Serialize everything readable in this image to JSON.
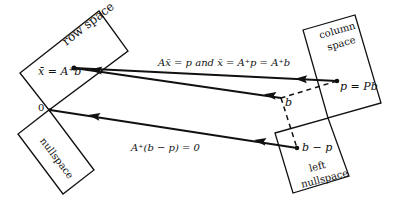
{
  "diagram": {
    "regions": {
      "row_space": "row space",
      "column_space_line1": "column",
      "column_space_line2": "space",
      "nullspace": "nullspace",
      "left_nullspace_line1": "left",
      "left_nullspace_line2": "nullspace"
    },
    "points": {
      "xbar": "x̄ = A⁺b",
      "origin": "0",
      "p": "p = Pb",
      "b": "b",
      "b_minus_p": "b − p"
    },
    "equations": {
      "top": "Ax̄ = p  and  x̄ = A⁺p = A⁺b",
      "bottom": "A⁺(b − p) = 0"
    },
    "colors": {
      "stroke": "#111111",
      "background": "#ffffff"
    }
  }
}
